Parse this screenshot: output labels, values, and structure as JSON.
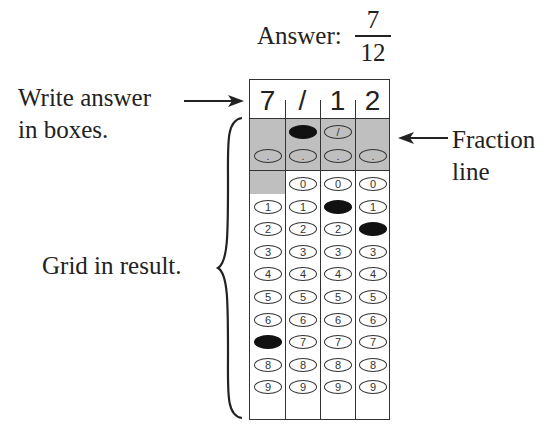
{
  "answer": {
    "label": "Answer:",
    "numerator": "7",
    "denominator": "12"
  },
  "labels": {
    "write_line1": "Write answer",
    "write_line2": "in boxes.",
    "fraction_line1": "Fraction",
    "fraction_line2": "line",
    "grid_result": "Grid in result."
  },
  "grid": {
    "written_answer": [
      "7",
      "/",
      "1",
      "2"
    ],
    "slash_symbol": "/",
    "dot_symbol": ".",
    "digits": [
      "0",
      "1",
      "2",
      "3",
      "4",
      "5",
      "6",
      "7",
      "8",
      "9"
    ],
    "filled": [
      {
        "column": 1,
        "value": "7"
      },
      {
        "column": 2,
        "value": "/"
      },
      {
        "column": 3,
        "value": "1"
      },
      {
        "column": 4,
        "value": "2"
      }
    ]
  },
  "colors": {
    "shade": "#bfbfbf",
    "ink": "#111111",
    "border": "#333333"
  }
}
